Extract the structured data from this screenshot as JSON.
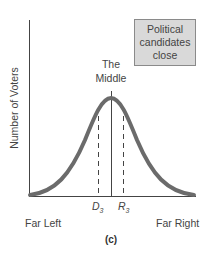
{
  "diagram": {
    "y_axis_label": "Number of Voters",
    "box_label": "Political candidates close",
    "middle_label_1": "The",
    "middle_label_2": "Middle",
    "markers": {
      "d_label": "D",
      "d_sub": "3",
      "r_label": "R",
      "r_sub": "3"
    },
    "x_left_label": "Far Left",
    "x_right_label": "Far Right",
    "caption": "(c)",
    "colors": {
      "curve": "#6b6b6b",
      "box_fill": "#d9d9d9",
      "axis": "#444444"
    }
  }
}
